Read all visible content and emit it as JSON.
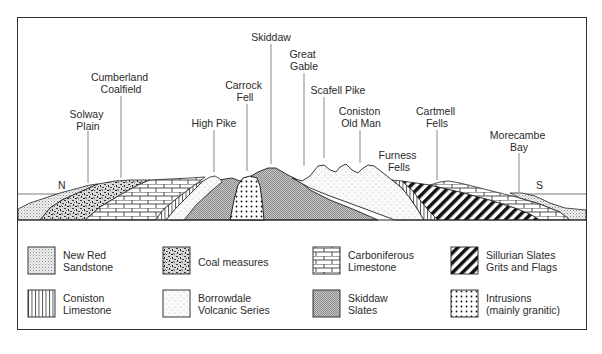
{
  "diagram": {
    "compass": {
      "north": "N",
      "south": "S"
    },
    "place_labels": [
      {
        "id": "solway-plain",
        "lines": [
          "Solway",
          "Plain"
        ]
      },
      {
        "id": "cumberland-coalfield",
        "lines": [
          "Cumberland",
          "Coalfield"
        ]
      },
      {
        "id": "high-pike",
        "lines": [
          "High Pike"
        ]
      },
      {
        "id": "carrock-fell",
        "lines": [
          "Carrock",
          "Fell"
        ]
      },
      {
        "id": "skiddaw",
        "lines": [
          "Skiddaw"
        ]
      },
      {
        "id": "great-gable",
        "lines": [
          "Great",
          "Gable"
        ]
      },
      {
        "id": "scafell-pike",
        "lines": [
          "Scafell Pike"
        ]
      },
      {
        "id": "coniston-old-man",
        "lines": [
          "Coniston",
          "Old Man"
        ]
      },
      {
        "id": "furness-fells",
        "lines": [
          "Furness",
          "Fells"
        ]
      },
      {
        "id": "cartmell-fells",
        "lines": [
          "Cartmell",
          "Fells"
        ]
      },
      {
        "id": "morecambe-bay",
        "lines": [
          "Morecambe",
          "Bay"
        ]
      }
    ]
  },
  "legend": {
    "items": [
      {
        "pattern": "new-red-sandstone",
        "line1": "New Red",
        "line2": "Sandstone"
      },
      {
        "pattern": "coal-measures",
        "line1": "Coal measures",
        "line2": ""
      },
      {
        "pattern": "carboniferous-limestone",
        "line1": "Carboniferous",
        "line2": "Limestone"
      },
      {
        "pattern": "sillurian-slates",
        "line1": "Sillurian Slates",
        "line2": "Grits and Flags"
      },
      {
        "pattern": "coniston-limestone",
        "line1": "Coniston",
        "line2": "Limestone"
      },
      {
        "pattern": "borrowdale-volcanic",
        "line1": "Borrowdale",
        "line2": "Volcanic Series"
      },
      {
        "pattern": "skiddaw-slates",
        "line1": "Skiddaw",
        "line2": "Slates"
      },
      {
        "pattern": "intrusions",
        "line1": "Intrusions",
        "line2": "(mainly granitic)"
      }
    ]
  }
}
